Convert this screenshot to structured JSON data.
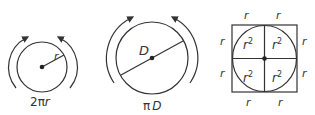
{
  "colors": {
    "stroke": "#333333",
    "background": "#ffffff"
  },
  "figure1": {
    "radius_label": "r",
    "caption": "2πr",
    "caption_prefix": "2π",
    "caption_var": "r"
  },
  "figure2": {
    "diameter_label": "D",
    "caption_prefix": "π",
    "caption_var": "D"
  },
  "figure3": {
    "side_labels": [
      "r",
      "r",
      "r",
      "r",
      "r",
      "r",
      "r",
      "r"
    ],
    "quadrant_base": "r",
    "quadrant_exp": "2"
  }
}
